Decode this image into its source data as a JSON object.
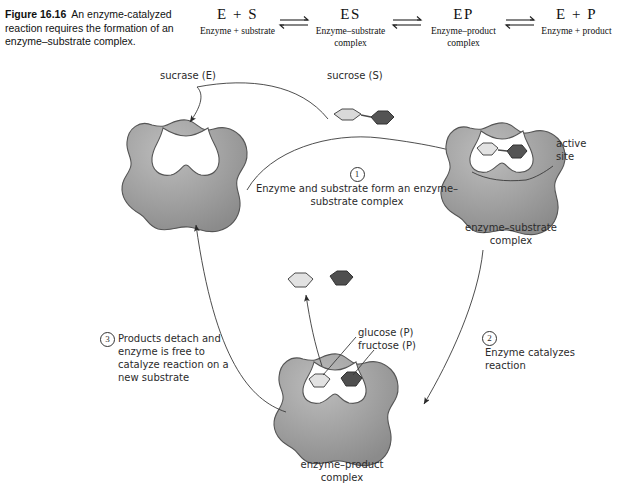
{
  "caption": {
    "figure_number": "Figure 16.16",
    "text": "An enzyme-catalyzed reaction requires the formation of an enzyme–substrate complex."
  },
  "equation": {
    "terms": [
      {
        "symbol": "E + S",
        "name": "Enzyme + substrate"
      },
      {
        "symbol": "ES",
        "name": "Enzyme–substrate complex"
      },
      {
        "symbol": "EP",
        "name": "Enzyme–product complex"
      },
      {
        "symbol": "E + P",
        "name": "Enzyme + product"
      }
    ],
    "arrow_type": "equilibrium-double-arrow",
    "arrow_count": 3
  },
  "labels": {
    "sucrase": "sucrase (E)",
    "sucrose": "sucrose (S)",
    "active_site": "active\nsite",
    "es_complex": "enzyme–substrate\ncomplex",
    "ep_complex": "enzyme–product\ncomplex",
    "glucose": "glucose (P)",
    "fructose": "fructose (P)"
  },
  "steps": [
    {
      "number": "1",
      "text": "Enzyme and substrate form an\nenzyme–substrate complex"
    },
    {
      "number": "2",
      "text": "Enzyme catalyzes\nreaction"
    },
    {
      "number": "3",
      "text": "Products detach\nand enzyme is free\nto catalyze reaction\non a new substrate"
    }
  ],
  "colors": {
    "enzyme_body": "#9d9d9d",
    "enzyme_shade": "#8a8a8a",
    "enzyme_highlight": "#b5b5b5",
    "enzyme_outline": "#4a4a4a",
    "glucose_light": "#d9d9d9",
    "fructose_dark": "#545454",
    "line": "#3a3a3a",
    "background": "#ffffff"
  },
  "molecules": {
    "substrate_free": {
      "glucose_shape": "hexagon",
      "fructose_shape": "hexagon",
      "bonded": true
    },
    "substrate_bound": {
      "glucose_shape": "hexagon",
      "fructose_shape": "hexagon",
      "bonded": true
    },
    "products_free": {
      "glucose_shape": "hexagon",
      "fructose_shape": "hexagon",
      "bonded": false
    },
    "products_bound": {
      "glucose_shape": "hexagon",
      "fructose_shape": "hexagon",
      "bonded": false
    }
  }
}
